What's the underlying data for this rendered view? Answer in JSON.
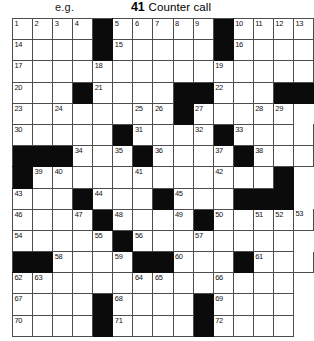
{
  "header": {
    "example_label": "e.g.",
    "clue_number": "41",
    "clue_text": "Counter call"
  },
  "grid": {
    "columns": 13,
    "rows": 15,
    "colors": {
      "block": "#0b0b0b",
      "cell": "#ffffff",
      "rule": "#4d4d4d",
      "number": "#111111"
    },
    "cells": [
      [
        {
          "n": "1"
        },
        {
          "n": "2"
        },
        {
          "n": "3"
        },
        {
          "n": "4"
        },
        {
          "b": true
        },
        {
          "n": "5"
        },
        {
          "n": "6"
        },
        {
          "n": "7"
        },
        {
          "n": "8"
        },
        {
          "n": "9"
        },
        {
          "b": true
        },
        {
          "n": "10"
        },
        {
          "n": "11"
        },
        {
          "n": "12"
        },
        {
          "n": "13"
        }
      ],
      [
        {
          "n": "14"
        },
        {},
        {},
        {},
        {
          "b": true
        },
        {
          "n": "15"
        },
        {},
        {},
        {},
        {},
        {
          "b": true
        },
        {
          "n": "16"
        },
        {},
        {},
        {}
      ],
      [
        {
          "n": "17"
        },
        {},
        {},
        {},
        {
          "n": "18"
        },
        {},
        {},
        {},
        {},
        {},
        {
          "n": "19"
        },
        {},
        {},
        {},
        {}
      ],
      [
        {
          "n": "20"
        },
        {},
        {},
        {
          "b": true
        },
        {
          "n": "21"
        },
        {},
        {},
        {},
        {
          "b": true
        },
        {
          "b": true
        },
        {
          "n": "22"
        },
        {},
        {},
        {
          "b": true
        },
        {
          "b": true
        }
      ],
      [
        {
          "n": "23"
        },
        {},
        {
          "n": "24"
        },
        {},
        {},
        {},
        {
          "n": "25"
        },
        {
          "n": "26"
        },
        {
          "b": true
        },
        {
          "n": "27"
        },
        {},
        {},
        {
          "n": "28"
        },
        {
          "n": "29"
        }
      ],
      [
        {
          "n": "30"
        },
        {},
        {},
        {},
        {},
        {
          "b": true
        },
        {
          "n": "31"
        },
        {},
        {},
        {
          "n": "32"
        },
        {
          "b": true
        },
        {
          "n": "33"
        },
        {},
        {},
        {}
      ],
      [
        {
          "b": true
        },
        {
          "b": true
        },
        {
          "b": true
        },
        {
          "n": "34"
        },
        {},
        {
          "n": "35"
        },
        {
          "b": true
        },
        {
          "n": "36"
        },
        {},
        {},
        {
          "n": "37"
        },
        {
          "b": true
        },
        {
          "n": "38"
        },
        {},
        {}
      ],
      [
        {
          "b": true
        },
        {
          "n": "39"
        },
        {
          "n": "40"
        },
        {},
        {},
        {},
        {
          "n": "41"
        },
        {},
        {},
        {},
        {
          "n": "42"
        },
        {},
        {},
        {
          "b": true
        }
      ],
      [
        {
          "n": "43"
        },
        {},
        {},
        {
          "b": true
        },
        {
          "n": "44"
        },
        {},
        {},
        {
          "b": true
        },
        {
          "n": "45"
        },
        {},
        {},
        {
          "b": true
        },
        {
          "b": true
        },
        {
          "b": true
        }
      ],
      [
        {
          "n": "46"
        },
        {},
        {},
        {
          "n": "47"
        },
        {
          "b": true
        },
        {
          "n": "48"
        },
        {},
        {},
        {
          "n": "49"
        },
        {
          "b": true
        },
        {
          "n": "50"
        },
        {},
        {
          "n": "51"
        },
        {
          "n": "52"
        },
        {
          "n": "53"
        }
      ],
      [
        {
          "n": "54"
        },
        {},
        {},
        {},
        {
          "n": "55"
        },
        {
          "b": true
        },
        {
          "n": "56"
        },
        {},
        {},
        {
          "n": "57"
        },
        {},
        {},
        {},
        {}
      ],
      [
        {
          "b": true
        },
        {
          "b": true
        },
        {
          "n": "58"
        },
        {},
        {},
        {
          "n": "59"
        },
        {
          "b": true
        },
        {
          "b": true
        },
        {
          "n": "60"
        },
        {},
        {},
        {
          "b": true
        },
        {
          "n": "61"
        },
        {},
        {}
      ],
      [
        {
          "n": "62"
        },
        {
          "n": "63"
        },
        {},
        {},
        {},
        {},
        {
          "n": "64"
        },
        {
          "n": "65"
        },
        {},
        {},
        {
          "n": "66"
        },
        {},
        {},
        {}
      ],
      [
        {
          "n": "67"
        },
        {},
        {},
        {},
        {
          "b": true
        },
        {
          "n": "68"
        },
        {},
        {},
        {},
        {
          "b": true
        },
        {
          "n": "69"
        },
        {},
        {},
        {}
      ],
      [
        {
          "n": "70"
        },
        {},
        {},
        {},
        {
          "b": true
        },
        {
          "n": "71"
        },
        {},
        {},
        {},
        {
          "b": true
        },
        {
          "n": "72"
        },
        {},
        {},
        {}
      ]
    ]
  }
}
